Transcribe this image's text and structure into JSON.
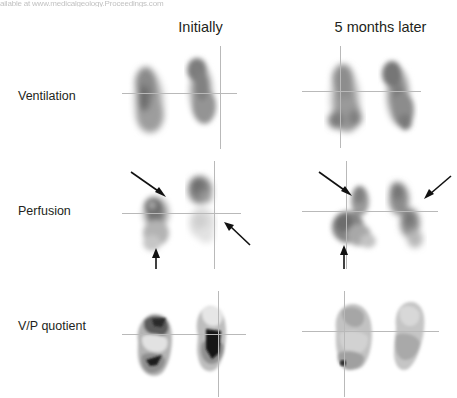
{
  "figure": {
    "top_artifact_text": "ailable at www.medicalgeology.Proceedings.com",
    "columns": [
      {
        "id": "initially",
        "label": "Initially"
      },
      {
        "id": "later",
        "label": "5 months later"
      }
    ],
    "rows": [
      {
        "id": "ventilation",
        "label": "Ventilation"
      },
      {
        "id": "perfusion",
        "label": "Perfusion"
      },
      {
        "id": "vp_quotient",
        "label": "V/P quotient"
      }
    ],
    "modality": "V/P SPECT lung scintigraphy",
    "view": "coronal",
    "colors": {
      "text": "#231f20",
      "background": "#ffffff",
      "crosshair": "#b9b9b9",
      "arrow": "#111111",
      "uptake_light": "#c9c9c9",
      "uptake_mid": "#8a8a8a",
      "uptake_dark": "#3a3a3a"
    }
  },
  "panels": [
    {
      "id": "ventilation-initially",
      "row": "Ventilation",
      "column": "Initially",
      "crosshair": {
        "h_y": 47,
        "v_x": 98
      },
      "arrows": []
    },
    {
      "id": "ventilation-later",
      "row": "Ventilation",
      "column": "5 months later",
      "crosshair": {
        "h_y": 45,
        "v_x": 38
      },
      "arrows": []
    },
    {
      "id": "perfusion-initially",
      "row": "Perfusion",
      "column": "Initially",
      "crosshair": {
        "h_y": 52,
        "v_x": 92
      },
      "arrows": [
        {
          "name": "perfusion-defect-arrow-upper-left",
          "direction": "down-right"
        },
        {
          "name": "perfusion-defect-arrow-lower-left",
          "direction": "up"
        },
        {
          "name": "perfusion-defect-arrow-right",
          "direction": "up-left"
        }
      ]
    },
    {
      "id": "perfusion-later",
      "row": "Perfusion",
      "column": "5 months later",
      "crosshair": {
        "h_y": 50,
        "v_x": 44
      },
      "arrows": [
        {
          "name": "perfusion-defect-arrow-upper-left",
          "direction": "down-right"
        },
        {
          "name": "perfusion-defect-arrow-lower-left",
          "direction": "up"
        },
        {
          "name": "perfusion-defect-arrow-upper-right",
          "direction": "down-left"
        }
      ]
    },
    {
      "id": "vp-quotient-initially",
      "row": "V/P quotient",
      "column": "Initially",
      "crosshair": {
        "h_y": 43,
        "v_x": 96
      },
      "arrows": []
    },
    {
      "id": "vp-quotient-later",
      "row": "V/P quotient",
      "column": "5 months later",
      "crosshair": {
        "h_y": 40,
        "v_x": 42
      },
      "arrows": []
    }
  ]
}
